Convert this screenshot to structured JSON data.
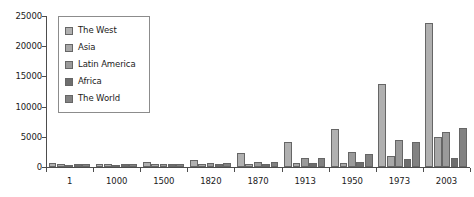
{
  "chart_data": {
    "type": "bar",
    "title": "",
    "subtitle": "",
    "xlabel": "",
    "ylabel": "",
    "ylim": [
      0,
      25000
    ],
    "ytick_values": [
      0,
      5000,
      10000,
      15000,
      20000,
      25000
    ],
    "ytick_labels": [
      "0",
      "5000",
      "10000",
      "15000",
      "20000",
      "25000"
    ],
    "grid": false,
    "legend_position": "top-left-inside",
    "categories": [
      "1",
      "1000",
      "1500",
      "1820",
      "1870",
      "1913",
      "1950",
      "1973",
      "2003"
    ],
    "series": [
      {
        "name": "The West",
        "color": "#b0b0b0",
        "values": [
          600,
          420,
          760,
          1200,
          2400,
          4100,
          6300,
          13800,
          23800
        ]
      },
      {
        "name": "Asia",
        "color": "#a8a8a8",
        "values": [
          460,
          460,
          570,
          580,
          560,
          700,
          640,
          1900,
          4900
        ]
      },
      {
        "name": "Latin America",
        "color": "#9a9a9a",
        "values": [
          400,
          400,
          420,
          690,
          800,
          1500,
          2500,
          4500,
          5800
        ]
      },
      {
        "name": "Africa",
        "color": "#6e6e6e",
        "values": [
          470,
          430,
          420,
          420,
          500,
          640,
          900,
          1400,
          1550
        ]
      },
      {
        "name": "The World",
        "color": "#828282",
        "values": [
          470,
          450,
          570,
          670,
          880,
          1530,
          2110,
          4100,
          6500
        ]
      }
    ]
  },
  "legend": {
    "items": [
      {
        "label": "The West"
      },
      {
        "label": "Asia"
      },
      {
        "label": "Latin America"
      },
      {
        "label": "Africa"
      },
      {
        "label": "The World"
      }
    ]
  }
}
